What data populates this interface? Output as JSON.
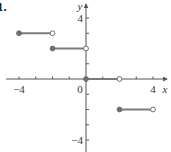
{
  "problem_label": "1.",
  "axes": {
    "x_label": "x",
    "y_label": "y",
    "x_ticks": [
      -4,
      -3,
      -2,
      -1,
      1,
      2,
      3,
      4
    ],
    "y_ticks": [
      -4,
      -3,
      -2,
      -1,
      1,
      2,
      3,
      4
    ],
    "x_tick_labels": [
      {
        "value": -4,
        "text": "−4"
      },
      {
        "value": 4,
        "text": "4"
      }
    ],
    "y_tick_labels": [
      {
        "value": 4,
        "text": "4"
      },
      {
        "value": -4,
        "text": "−4"
      }
    ],
    "origin_label": "0"
  },
  "colors": {
    "axis": "#555555",
    "segment": "#7a7a7a",
    "point_fill": "#6e6e6e",
    "open_point_fill": "#ffffff"
  },
  "chart_data": {
    "type": "line",
    "title": "",
    "subtitle": "Step function (piecewise constant)",
    "xlabel": "x",
    "ylabel": "y",
    "xlim": [
      -4.5,
      4.5
    ],
    "ylim": [
      -4.5,
      4.5
    ],
    "grid": false,
    "legend": null,
    "series": [
      {
        "name": "segment-1",
        "x": [
          -4,
          -2
        ],
        "y": [
          3,
          3
        ],
        "left_endpoint": "closed",
        "right_endpoint": "open"
      },
      {
        "name": "segment-2",
        "x": [
          -2,
          0
        ],
        "y": [
          2,
          2
        ],
        "left_endpoint": "closed",
        "right_endpoint": "open"
      },
      {
        "name": "segment-3",
        "x": [
          0,
          2
        ],
        "y": [
          0,
          0
        ],
        "left_endpoint": "closed",
        "right_endpoint": "open"
      },
      {
        "name": "segment-4",
        "x": [
          2,
          4
        ],
        "y": [
          -2,
          -2
        ],
        "left_endpoint": "closed",
        "right_endpoint": "open"
      }
    ],
    "annotations": [
      "1."
    ]
  }
}
